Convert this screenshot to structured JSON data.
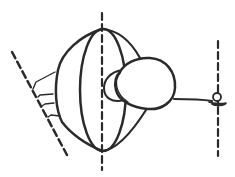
{
  "diagram": {
    "stroke_color": "#2a2a2a",
    "background": "#ffffff",
    "elements": [
      {
        "name": "left-slanted-dashed-line",
        "type": "dashed-line"
      },
      {
        "name": "central-vertical-dashed-axis",
        "type": "dashed-line"
      },
      {
        "name": "right-vertical-dashed-line",
        "type": "dashed-line"
      },
      {
        "name": "dish-outline",
        "type": "shape"
      },
      {
        "name": "inner-ellipse",
        "type": "ellipse"
      },
      {
        "name": "bulb-shape",
        "type": "shape"
      },
      {
        "name": "tether-line",
        "type": "line"
      },
      {
        "name": "small-circle-anchor",
        "type": "circle"
      },
      {
        "name": "support-ticks",
        "type": "lines",
        "count": 4
      }
    ]
  }
}
